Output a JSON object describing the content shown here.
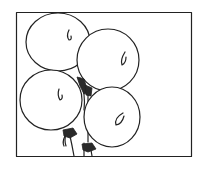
{
  "illustration": {
    "title": "Bunch of four balloons",
    "style": "black line drawing on white",
    "colors": {
      "ink": "#222222",
      "background": "#ffffff"
    },
    "frame": {
      "x": 16,
      "y": 12,
      "width": 176,
      "height": 145
    },
    "balloons": [
      {
        "name": "top-left",
        "cx": 58,
        "cy": 42,
        "rx": 32,
        "ry": 29
      },
      {
        "name": "top-right",
        "cx": 108,
        "cy": 60,
        "rx": 31,
        "ry": 31
      },
      {
        "name": "bottom-left",
        "cx": 51,
        "cy": 100,
        "rx": 31,
        "ry": 30
      },
      {
        "name": "bottom-right",
        "cx": 112,
        "cy": 117,
        "rx": 28,
        "ry": 30
      }
    ]
  }
}
